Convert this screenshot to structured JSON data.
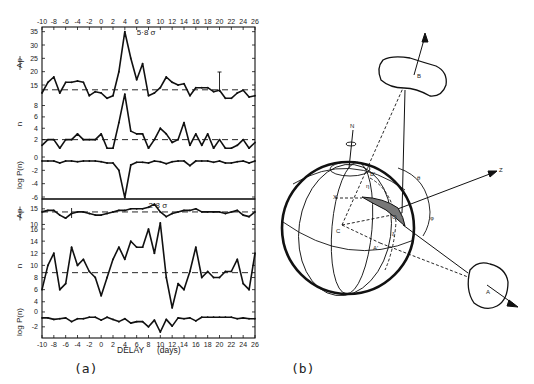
{
  "figure": {
    "panel_a_label": "(a)",
    "panel_b_label": "(b)",
    "xlabel": "DELAY",
    "xlabel_units": "(days)"
  },
  "chart_data": [
    {
      "type": "line",
      "title": "Upper block",
      "annotation": "5·8 σ",
      "x": [
        -10,
        -9,
        -8,
        -7,
        -6,
        -5,
        -4,
        -3,
        -2,
        -1,
        0,
        1,
        2,
        3,
        4,
        5,
        6,
        7,
        8,
        9,
        10,
        11,
        12,
        13,
        14,
        15,
        16,
        17,
        18,
        19,
        20,
        21,
        22,
        23,
        24,
        25,
        26
      ],
      "xticks": [
        -10,
        -8,
        -6,
        -4,
        -2,
        0,
        2,
        4,
        6,
        8,
        10,
        12,
        14,
        16,
        18,
        20,
        22,
        24,
        26
      ],
      "xlim": [
        -10,
        26
      ],
      "subpanels": [
        {
          "ylabel": "Ap (mean)",
          "yticks": [
            15,
            20,
            25,
            30,
            35
          ],
          "ylim": [
            10,
            36
          ],
          "mean_line": 13.2,
          "values": [
            12,
            16,
            18,
            12,
            16,
            16,
            16.5,
            16,
            11,
            12.5,
            12,
            10,
            11,
            20,
            35,
            25,
            17,
            23,
            11,
            12,
            14,
            18,
            16,
            15,
            15.5,
            11,
            14,
            14,
            14,
            12.5,
            13,
            10,
            10,
            12,
            13,
            10.5,
            11
          ]
        },
        {
          "ylabel": "n",
          "yticks": [
            2,
            4,
            6,
            8
          ],
          "ylim": [
            0,
            9.5
          ],
          "mean_line": 2,
          "values": [
            1,
            2,
            2,
            0.5,
            2,
            2,
            3,
            2,
            2,
            2,
            3,
            0.5,
            0.5,
            5,
            10,
            3.5,
            3,
            3,
            0.5,
            2,
            4,
            3,
            1.5,
            2,
            5,
            1,
            3,
            1,
            3,
            0.5,
            2,
            0.5,
            0.5,
            1,
            2,
            0.5,
            1.5
          ]
        },
        {
          "ylabel": "log P(n)",
          "yticks": [
            0,
            -2,
            -4,
            -6
          ],
          "ylim": [
            -6.5,
            0.5
          ],
          "values": [
            -0.6,
            -0.6,
            -0.6,
            -0.9,
            -0.6,
            -0.6,
            -0.7,
            -0.6,
            -0.6,
            -0.6,
            -0.7,
            -0.9,
            -0.9,
            -2,
            -6.1,
            -1.2,
            -0.8,
            -0.8,
            -0.9,
            -0.6,
            -0.7,
            -1,
            -0.7,
            -0.6,
            -0.6,
            -1.3,
            -0.6,
            -0.6,
            -0.6,
            -0.8,
            -0.6,
            -0.9,
            -0.9,
            -0.7,
            -0.6,
            -0.9,
            -0.6
          ]
        }
      ]
    },
    {
      "type": "line",
      "title": "Lower block",
      "annotation": "2·8 σ",
      "x": [
        -10,
        -9,
        -8,
        -7,
        -6,
        -5,
        -4,
        -3,
        -2,
        -1,
        0,
        1,
        2,
        3,
        4,
        5,
        6,
        7,
        8,
        9,
        10,
        11,
        12,
        13,
        14,
        15,
        16,
        17,
        18,
        19,
        20,
        21,
        22,
        23,
        24,
        25,
        26
      ],
      "xticks": [
        -10,
        -8,
        -6,
        -4,
        -2,
        0,
        2,
        4,
        6,
        8,
        10,
        12,
        14,
        16,
        18,
        20,
        22,
        24,
        26
      ],
      "xlabel": "DELAY (days)",
      "xlim": [
        -10,
        26
      ],
      "subpanels": [
        {
          "ylabel": "Ap (mean)",
          "yticks": [
            10,
            15
          ],
          "ylim": [
            9,
            17
          ],
          "mean_line": 14,
          "values": [
            14,
            14.5,
            14.5,
            13,
            12,
            13.5,
            14,
            14,
            13.5,
            13,
            13,
            13.5,
            14,
            14.5,
            14.5,
            15,
            15,
            15,
            15.5,
            16.5,
            14,
            12.5,
            13.5,
            14,
            14.5,
            14.5,
            15,
            14,
            14,
            14,
            14,
            13.5,
            14,
            14.5,
            13,
            12.5,
            14
          ]
        },
        {
          "ylabel": "n",
          "yticks": [
            4,
            6,
            8,
            10,
            12,
            14,
            16
          ],
          "ylim": [
            3,
            16.5
          ],
          "mean_line": 8.8,
          "values": [
            6,
            10,
            12,
            6,
            7,
            13,
            10,
            11,
            9,
            8,
            5,
            8,
            11,
            13,
            11,
            14,
            13,
            13,
            16,
            12,
            17,
            8,
            3,
            7,
            6,
            9,
            13,
            8,
            9,
            8,
            8,
            9,
            9,
            11,
            7,
            6,
            12
          ]
        },
        {
          "ylabel": "log P(n)",
          "yticks": [
            0,
            -2
          ],
          "ylim": [
            -3.2,
            0.5
          ],
          "values": [
            -0.8,
            -0.8,
            -1,
            -0.9,
            -0.8,
            -1.3,
            -0.9,
            -0.9,
            -0.7,
            -0.7,
            -1.1,
            -0.7,
            -1,
            -1.3,
            -0.9,
            -1.5,
            -1.3,
            -1.3,
            -2,
            -1.1,
            -2.7,
            -1,
            -1.9,
            -0.8,
            -0.9,
            -0.8,
            -1.2,
            -0.7,
            -0.7,
            -0.7,
            -0.7,
            -0.7,
            -0.7,
            -0.9,
            -0.8,
            -0.9,
            -0.9
          ]
        }
      ]
    }
  ],
  "diagram": {
    "labels": {
      "north": "N",
      "z_axis": "Z",
      "center": "C",
      "point_o": "O",
      "point_x": "X",
      "point_a_prime": "A'",
      "point_b_prime": "B'",
      "cloud_b": "B",
      "cloud_a": "A",
      "angle_theta": "θ",
      "angle_phi": "φ",
      "angle_xi": "ξ",
      "angle_eta": "η"
    }
  }
}
